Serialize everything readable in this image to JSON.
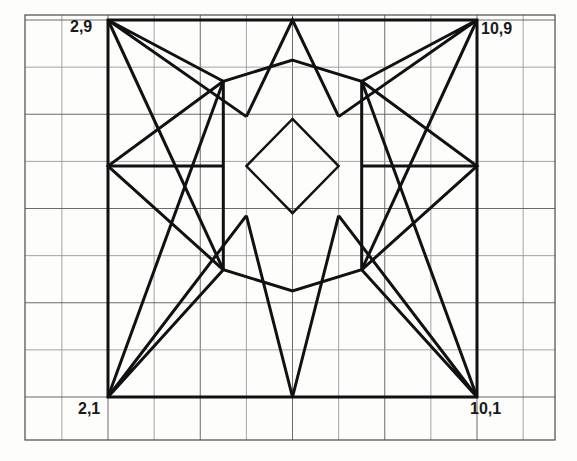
{
  "figure": {
    "labels": {
      "top_left": "2,9",
      "top_right": "10,9",
      "bottom_left": "2,1",
      "bottom_right": "10,1"
    },
    "colors": {
      "ink": "#111111",
      "grid_major": "#5a5a5a",
      "grid_minor": "#9a9a9a",
      "paper": "#fdfdfc"
    }
  },
  "chart_data": {
    "type": "line",
    "xlabel": "",
    "ylabel": "",
    "xlim": [
      0,
      12.2
    ],
    "ylim": [
      0,
      10.6
    ],
    "grid": true,
    "legend": "none",
    "grid_spacing": 1,
    "annotations": [
      {
        "text": "2,9",
        "x": 2,
        "y": 9,
        "placement": "outside-top-left"
      },
      {
        "text": "10,9",
        "x": 10,
        "y": 9,
        "placement": "outside-top-right"
      },
      {
        "text": "2,1",
        "x": 2,
        "y": 1,
        "placement": "outside-bottom-left"
      },
      {
        "text": "10,1",
        "x": 10,
        "y": 1,
        "placement": "outside-bottom-right"
      }
    ],
    "series": [
      {
        "name": "bounding-square",
        "closed": true,
        "points": [
          [
            2,
            9
          ],
          [
            10,
            9
          ],
          [
            10,
            1
          ],
          [
            2,
            1
          ]
        ]
      },
      {
        "name": "octagon",
        "closed": true,
        "points": [
          [
            6,
            8.15
          ],
          [
            7.5,
            7.7
          ],
          [
            7.5,
            5.9
          ],
          [
            7.5,
            3.7
          ],
          [
            6,
            3.25
          ],
          [
            4.5,
            3.7
          ],
          [
            4.5,
            5.9
          ],
          [
            4.5,
            7.7
          ]
        ]
      },
      {
        "name": "inner-diamond",
        "closed": true,
        "points": [
          [
            6,
            6.9
          ],
          [
            7,
            5.9
          ],
          [
            6,
            4.9
          ],
          [
            5,
            5.9
          ]
        ]
      },
      {
        "name": "star-point-top",
        "closed": false,
        "points": [
          [
            5,
            6.95
          ],
          [
            6,
            9
          ],
          [
            7,
            6.95
          ]
        ]
      },
      {
        "name": "star-point-bottom",
        "closed": false,
        "points": [
          [
            5,
            4.85
          ],
          [
            6,
            1
          ],
          [
            7,
            4.85
          ]
        ]
      },
      {
        "name": "star-point-left",
        "closed": false,
        "points": [
          [
            4.5,
            7.7
          ],
          [
            2,
            5.9
          ],
          [
            4.5,
            3.7
          ]
        ]
      },
      {
        "name": "star-point-left-axis",
        "closed": false,
        "points": [
          [
            2,
            5.9
          ],
          [
            4.5,
            5.9
          ]
        ]
      },
      {
        "name": "star-point-right",
        "closed": false,
        "points": [
          [
            7.5,
            7.7
          ],
          [
            10,
            5.9
          ],
          [
            7.5,
            3.7
          ]
        ]
      },
      {
        "name": "star-point-right-axis",
        "closed": false,
        "points": [
          [
            7.5,
            5.9
          ],
          [
            10,
            5.9
          ]
        ]
      },
      {
        "name": "corner-rays-top-left",
        "closed": false,
        "points": [
          [
            5,
            6.95
          ],
          [
            2,
            9
          ],
          [
            4.5,
            7.7
          ]
        ]
      },
      {
        "name": "corner-ray-top-left-long",
        "closed": false,
        "points": [
          [
            2,
            9
          ],
          [
            4.5,
            3.7
          ]
        ]
      },
      {
        "name": "corner-rays-top-right",
        "closed": false,
        "points": [
          [
            7,
            6.95
          ],
          [
            10,
            9
          ],
          [
            7.5,
            7.7
          ]
        ]
      },
      {
        "name": "corner-ray-top-right-long",
        "closed": false,
        "points": [
          [
            10,
            9
          ],
          [
            7.5,
            3.7
          ]
        ]
      },
      {
        "name": "corner-rays-bottom-left",
        "closed": false,
        "points": [
          [
            5,
            4.85
          ],
          [
            2,
            1
          ],
          [
            4.5,
            3.7
          ]
        ]
      },
      {
        "name": "corner-ray-bottom-left-long",
        "closed": false,
        "points": [
          [
            2,
            1
          ],
          [
            4.5,
            7.7
          ]
        ]
      },
      {
        "name": "corner-rays-bottom-right",
        "closed": false,
        "points": [
          [
            7,
            4.85
          ],
          [
            10,
            1
          ],
          [
            7.5,
            3.7
          ]
        ]
      },
      {
        "name": "corner-ray-bottom-right-long",
        "closed": false,
        "points": [
          [
            10,
            1
          ],
          [
            7.5,
            7.7
          ]
        ]
      }
    ]
  }
}
